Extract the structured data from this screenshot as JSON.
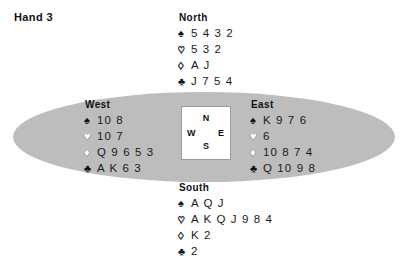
{
  "title": "Hand 3",
  "suits": {
    "spade": "♠",
    "heart": "♡",
    "diamond": "♢",
    "club": "♣",
    "heart_solid": "♥",
    "diamond_solid": "♦"
  },
  "compass": {
    "north": "N",
    "south": "S",
    "west": "W",
    "east": "E"
  },
  "colors": {
    "table": "#bdbdbd",
    "box_background": "#ffffff",
    "box_border": "#9a9a9a",
    "text": "#1a1a1a",
    "page_background": "#ffffff"
  },
  "hands": {
    "north": {
      "label": "North",
      "spades": "5 4 3 2",
      "hearts": "5 3 2",
      "diamonds": "A J",
      "clubs": "J 7 5 4"
    },
    "west": {
      "label": "West",
      "spades": "10 8",
      "hearts": "10 7",
      "diamonds": "Q 9 6 5 3",
      "clubs": "A K 6 3"
    },
    "east": {
      "label": "East",
      "spades": "K 9 7 6",
      "hearts": "6",
      "diamonds": "10 8 7 4",
      "clubs": "Q 10 9 8"
    },
    "south": {
      "label": "South",
      "spades": "A Q J",
      "hearts": "A K Q J 9 8 4",
      "diamonds": "K 2",
      "clubs": "2"
    }
  }
}
